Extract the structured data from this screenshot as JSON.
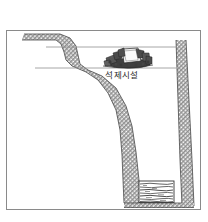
{
  "figure": {
    "type": "archaeological-cross-section",
    "title": "",
    "background_color": "#ffffff",
    "frame": {
      "name": "figure-border",
      "color": "#8a8a8a",
      "x": 6,
      "y": 30,
      "width": 195,
      "height": 180,
      "stroke_width": 1
    },
    "labels": [
      {
        "id": "stone-facility",
        "text": "석제시설",
        "meaning": "stone facility",
        "x": 122,
        "y": 78,
        "font_size": 8.5,
        "color": "#2b2b2b"
      }
    ],
    "elements": {
      "ground_line_upper": {
        "name": "upper-ground-surface-line",
        "color": "#8f8f8f",
        "from_x": 46,
        "to_x": 176,
        "y": 47
      },
      "ground_line_lower": {
        "name": "lower-ground-surface-line",
        "color": "#8f8f8f",
        "from_x": 35,
        "to_x": 176,
        "y": 68
      },
      "hatched_soil_band": {
        "name": "hatched-soil-layer",
        "fill": "#9a9a9a",
        "pattern": "diagonal-crosshatch",
        "description": "stepped slope profile descending left to right into pit"
      },
      "right_wall": {
        "name": "right-pit-wall",
        "fill": "#9a9a9a",
        "pattern": "diagonal-crosshatch",
        "top_x": 176,
        "bottom_x": 186
      },
      "pit_floor": {
        "name": "pit-floor",
        "y": 203
      },
      "stone_facility_cluster": {
        "name": "stone-facility-cluster",
        "center_x": 127,
        "center_y": 58,
        "width": 44,
        "height": 20,
        "fill": "#4a4a4a",
        "highlight_fill": "#f2f2f2",
        "stone_count": 14
      },
      "timber_fill_box": {
        "name": "timber-fill-deposit",
        "x": 139,
        "y": 181,
        "width": 35,
        "height": 21,
        "border_color": "#333333",
        "fill_pattern": "horizontal-wavy-layers",
        "layer_count": 8
      }
    },
    "colors": {
      "frame": "#8a8a8a",
      "hatch": "#8d8d8d",
      "line": "#3a3a3a",
      "text": "#2b2b2b",
      "paper": "#ffffff"
    }
  }
}
